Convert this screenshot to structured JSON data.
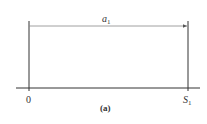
{
  "diagram": {
    "arrow_label": {
      "main": "a",
      "sub": "1"
    },
    "axis_labels": {
      "origin": "0",
      "end": {
        "main": "S",
        "sub": "1"
      }
    },
    "caption": "(a)",
    "colors": {
      "line": "#333333",
      "arrow": "#777777",
      "background": "#ffffff"
    }
  }
}
